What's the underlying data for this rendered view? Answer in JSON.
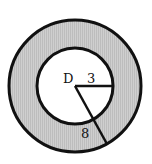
{
  "diagram": {
    "type": "annulus",
    "center_label": "D",
    "inner_radius_label": "3",
    "outer_radius_label": "8",
    "shading_color": "#c8c8c8",
    "stroke_color": "#111111",
    "geometry": {
      "cx": 75,
      "cy": 86,
      "outer_r": 66,
      "inner_r": 38,
      "inner_radius_end": [
        113,
        86
      ],
      "outer_radius_end": [
        107,
        144
      ]
    }
  }
}
